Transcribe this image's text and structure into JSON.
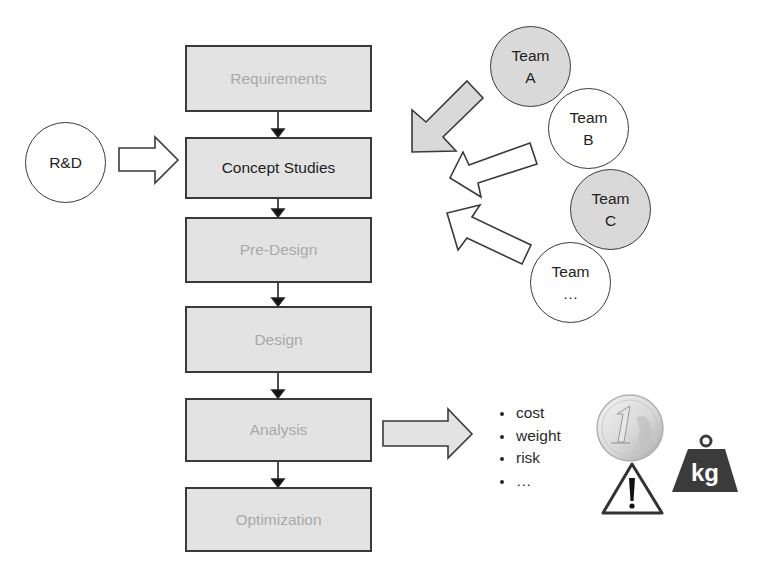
{
  "process": {
    "stages": [
      {
        "label": "Requirements",
        "active": false
      },
      {
        "label": "Concept Studies",
        "active": true
      },
      {
        "label": "Pre-Design",
        "active": false
      },
      {
        "label": "Design",
        "active": false
      },
      {
        "label": "Analysis",
        "active": false
      },
      {
        "label": "Optimization",
        "active": false
      }
    ]
  },
  "inputs": {
    "rnd": {
      "label": "R&D"
    }
  },
  "teams": [
    {
      "line1": "Team",
      "line2": "A",
      "fill": "gray"
    },
    {
      "line1": "Team",
      "line2": "B",
      "fill": "white"
    },
    {
      "line1": "Team",
      "line2": "C",
      "fill": "gray"
    },
    {
      "line1": "Team",
      "line2": "…",
      "fill": "white"
    }
  ],
  "outputs": {
    "criteria": [
      "cost",
      "weight",
      "risk",
      "…"
    ],
    "icons": [
      "euro-coin-icon",
      "warning-icon",
      "kg-weight-icon"
    ],
    "kg_label": "kg"
  },
  "colors": {
    "box_fill": "#e3e3e3",
    "border": "#3a3a3a",
    "inactive_text": "#a9a9a9",
    "active_text": "#1e1e1e",
    "team_gray": "#d9d9d9",
    "weight_fill": "#3b3b3b"
  }
}
